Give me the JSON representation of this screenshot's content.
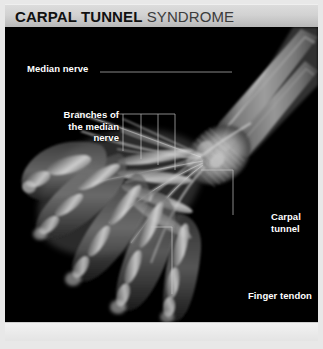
{
  "header": {
    "title_bold": "CARPAL TUNNEL",
    "title_light": " SYNDROME"
  },
  "illustration": {
    "type": "anatomical-xray-illustration",
    "subject": "human-hand-and-wrist",
    "view": "palmar-oblique",
    "background_color": "#000000",
    "structures": [
      "radius",
      "ulna",
      "carpal-bones",
      "metacarpals",
      "phalanges",
      "flexor-tendons",
      "median-nerve",
      "transverse-carpal-ligament"
    ]
  },
  "labels": {
    "median_nerve": "Median nerve",
    "branches": "Branches of\nthe median\nnerve",
    "carpal_tunnel": "Carpal\ntunnel",
    "finger_tendon": "Finger tendon"
  },
  "colors": {
    "header_light": "#dcdcdc",
    "header_dark": "#b8b8b8",
    "panel_background": "#000000",
    "label_text": "#ffffff",
    "leader_line": "#c8c8c8",
    "title_bold": "#111111",
    "title_light": "#3c3c3c",
    "frame": "#e8e8e8"
  }
}
